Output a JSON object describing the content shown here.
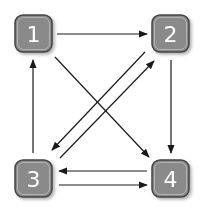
{
  "diagram": {
    "type": "directed-graph",
    "colors": {
      "node_fill": "#8a8a8a",
      "node_stroke": "#444444",
      "node_inner_stroke": "#e0e0e0",
      "edge": "#1a1a1a",
      "label": "#ffffff",
      "background": "#ffffff"
    },
    "nodes": [
      {
        "id": "1",
        "label": "1",
        "x": 15,
        "y": 15
      },
      {
        "id": "2",
        "label": "2",
        "x": 152,
        "y": 15
      },
      {
        "id": "3",
        "label": "3",
        "x": 15,
        "y": 160
      },
      {
        "id": "4",
        "label": "4",
        "x": 152,
        "y": 160
      }
    ],
    "edges": [
      {
        "from": "1",
        "to": "2"
      },
      {
        "from": "1",
        "to": "4"
      },
      {
        "from": "2",
        "to": "4"
      },
      {
        "from": "2",
        "to": "3"
      },
      {
        "from": "3",
        "to": "2"
      },
      {
        "from": "3",
        "to": "1"
      },
      {
        "from": "4",
        "to": "3"
      },
      {
        "from": "3",
        "to": "4"
      }
    ]
  }
}
